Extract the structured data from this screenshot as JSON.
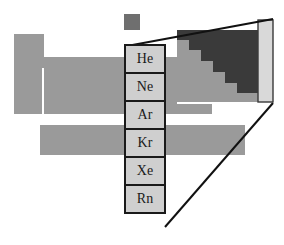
{
  "figure": {
    "canvas": {
      "width": 284,
      "height": 245,
      "background": "#ffffff"
    },
    "colors": {
      "table_body": "#9a9a9a",
      "metalloid_dark": "#3a3a3a",
      "highlight_cell_fill": "#cfcfcf",
      "highlight_cell_border": "#1a1a1a",
      "callout_line": "#111111",
      "magnified_column_fill": "#d9d9d9",
      "background": "#ffffff"
    }
  },
  "hydrogen_square": {
    "label": "hydrogen-cell",
    "x": 124,
    "y": 14,
    "width": 16,
    "height": 16,
    "fill": "#6f6f6f"
  },
  "table_silhouette": {
    "name": "periodic-table-body",
    "fill": "#9a9a9a",
    "blocks": [
      {
        "name": "group1-column",
        "x": 14,
        "y": 34,
        "width": 30,
        "height": 80
      },
      {
        "name": "main-body-rows",
        "x": 14,
        "y": 57,
        "width": 198,
        "height": 57
      },
      {
        "name": "group2-notch-gap",
        "x": 42,
        "y": 68,
        "width": 2,
        "height": 46,
        "fill": "#ffffff"
      },
      {
        "name": "f-block-row",
        "x": 40,
        "y": 125,
        "width": 205,
        "height": 30
      }
    ]
  },
  "noble_gas_group": {
    "name": "noble-gas-column",
    "x": 125,
    "y": 45,
    "cell_width": 40,
    "cell_height": 28,
    "cells": [
      {
        "symbol": "He",
        "name": "helium"
      },
      {
        "symbol": "Ne",
        "name": "neon"
      },
      {
        "symbol": "Ar",
        "name": "argon"
      },
      {
        "symbol": "Kr",
        "name": "krypton"
      },
      {
        "symbol": "Xe",
        "name": "xenon"
      },
      {
        "symbol": "Rn",
        "name": "radon"
      }
    ]
  },
  "magnified_inset": {
    "name": "magnified-region",
    "x": 177,
    "y": 20,
    "width": 97,
    "height": 82,
    "metalloid_staircase_color": "#3a3a3a",
    "p_block_color": "#9a9a9a",
    "noble_strip": {
      "name": "magnified-noble-gas-strip",
      "x": 258,
      "y": 20,
      "width": 15,
      "height": 82,
      "fill": "#d9d9d9",
      "stroke": "#3a3a3a"
    },
    "staircase_steps": [
      {
        "x": 177,
        "y": 30,
        "width": 12,
        "height": 10
      },
      {
        "x": 189,
        "y": 30,
        "width": 69,
        "height": 10
      },
      {
        "x": 189,
        "y": 40,
        "width": 69,
        "height": 10
      },
      {
        "x": 201,
        "y": 50,
        "width": 57,
        "height": 11
      },
      {
        "x": 213,
        "y": 61,
        "width": 45,
        "height": 11
      },
      {
        "x": 225,
        "y": 72,
        "width": 33,
        "height": 11
      },
      {
        "x": 237,
        "y": 83,
        "width": 21,
        "height": 10
      }
    ]
  },
  "callout_lines": {
    "name": "magnifier-callout-lines",
    "stroke": "#111111",
    "stroke_width": 2,
    "top_line": {
      "x1": 127,
      "y1": 46,
      "x2": 273,
      "y2": 19
    },
    "bottom_line": {
      "x1": 165,
      "y1": 227,
      "x2": 273,
      "y2": 103
    }
  }
}
